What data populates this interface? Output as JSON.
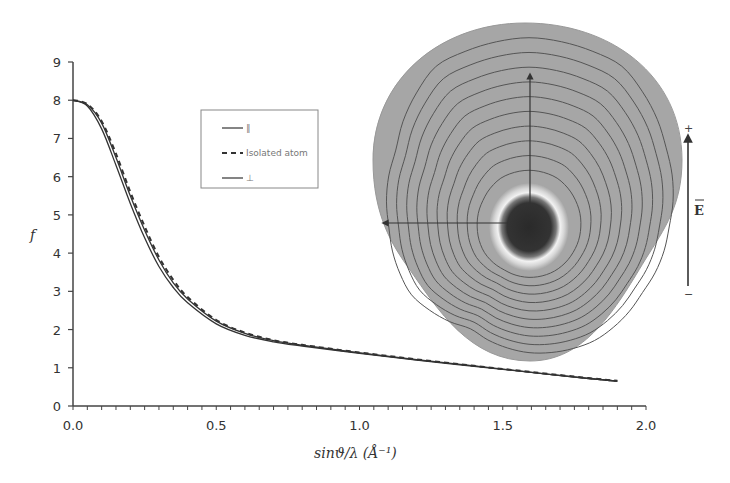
{
  "chart_data": {
    "type": "line",
    "title": "",
    "xlabel": "sinϑ/λ (Å⁻¹)",
    "ylabel": "f",
    "xlim": [
      0.0,
      2.0
    ],
    "ylim": [
      0,
      9
    ],
    "x_ticks": [
      "0.0",
      "0.5",
      "1.0",
      "1.5",
      "2.0"
    ],
    "y_ticks": [
      "0",
      "1",
      "2",
      "3",
      "4",
      "5",
      "6",
      "7",
      "8",
      "9"
    ],
    "x_minor_tick_step": 0.05,
    "grid": false,
    "legend_position": "upper-center",
    "x": [
      0.0,
      0.05,
      0.1,
      0.15,
      0.2,
      0.25,
      0.3,
      0.35,
      0.4,
      0.5,
      0.6,
      0.7,
      0.8,
      1.0,
      1.2,
      1.4,
      1.6,
      1.8,
      1.9
    ],
    "series": [
      {
        "name": "∥",
        "style": "solid",
        "values": [
          8.0,
          7.85,
          7.25,
          6.3,
          5.3,
          4.4,
          3.65,
          3.1,
          2.7,
          2.15,
          1.85,
          1.68,
          1.57,
          1.38,
          1.2,
          1.04,
          0.88,
          0.72,
          0.65
        ]
      },
      {
        "name": "Isolated atom",
        "style": "dashed",
        "values": [
          8.0,
          7.9,
          7.45,
          6.6,
          5.6,
          4.7,
          3.9,
          3.3,
          2.85,
          2.25,
          1.92,
          1.72,
          1.6,
          1.4,
          1.22,
          1.05,
          0.89,
          0.73,
          0.66
        ]
      },
      {
        "name": "⊥",
        "style": "solid",
        "values": [
          8.0,
          7.88,
          7.4,
          6.5,
          5.5,
          4.6,
          3.82,
          3.22,
          2.8,
          2.22,
          1.9,
          1.71,
          1.59,
          1.39,
          1.21,
          1.05,
          0.88,
          0.72,
          0.65
        ]
      }
    ],
    "inset": {
      "description": "Electron density contour map of atom polarized by electric field",
      "contour_levels": 10,
      "field_label": "E",
      "field_plus": "+",
      "field_minus": "−"
    }
  },
  "axes": {
    "ylabel": "f",
    "xlabel": "sinϑ/λ (Å⁻¹)"
  },
  "legend": {
    "items": [
      {
        "label": "∥",
        "style": "solid"
      },
      {
        "label": "Isolated atom",
        "style": "dashed"
      },
      {
        "label": "⊥",
        "style": "solid"
      }
    ]
  },
  "inset": {
    "field_label": "E",
    "plus": "+",
    "minus": "−"
  },
  "colors": {
    "axis": "#444444",
    "curve": "#333333",
    "blob_fill": "#a6a6a6",
    "contour": "#555555",
    "core": "#2b2b2b"
  }
}
